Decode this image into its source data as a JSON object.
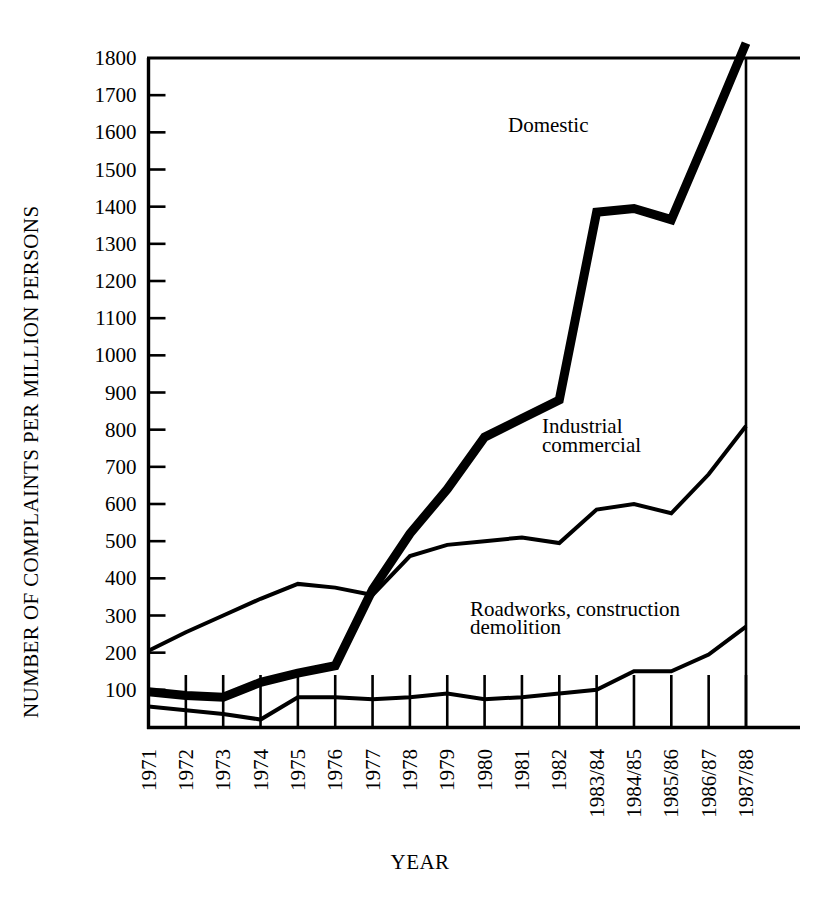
{
  "chart_data": {
    "type": "line",
    "title": "",
    "xlabel": "YEAR",
    "ylabel": "NUMBER OF COMPLAINTS PER MILLION PERSONS",
    "categories": [
      "1971",
      "1972",
      "1973",
      "1974",
      "1975",
      "1976",
      "1977",
      "1978",
      "1979",
      "1980",
      "1981",
      "1982",
      "1983/84",
      "1984/85",
      "1985/86",
      "1986/87",
      "1987/88"
    ],
    "ylim": [
      0,
      1800
    ],
    "yticks": [
      100,
      200,
      300,
      400,
      500,
      600,
      700,
      800,
      900,
      1000,
      1100,
      1200,
      1300,
      1400,
      1500,
      1600,
      1700,
      1800
    ],
    "ytick_labels": [
      "100",
      "200",
      "300",
      "400",
      "500",
      "600",
      "700",
      "800",
      "900",
      "1000",
      "1100",
      "1200",
      "1300",
      "1400",
      "1500",
      "1600",
      "1700",
      "1800"
    ],
    "grid": false,
    "legend": "inline-annotations",
    "series": [
      {
        "name": "Domestic",
        "label": "Domestic",
        "stroke_width": 9,
        "values": [
          95,
          85,
          80,
          120,
          145,
          165,
          370,
          520,
          640,
          780,
          830,
          880,
          1385,
          1395,
          1365,
          1600,
          1840
        ]
      },
      {
        "name": "Industrial commercial",
        "label_line1": "Industrial",
        "label_line2": "commercial",
        "stroke_width": 4,
        "values": [
          205,
          255,
          300,
          345,
          385,
          375,
          355,
          460,
          490,
          500,
          510,
          495,
          585,
          600,
          575,
          680,
          810
        ]
      },
      {
        "name": "Roadworks, construction demolition",
        "label_line1": "Roadworks, construction",
        "label_line2": "demolition",
        "stroke_width": 4,
        "values": [
          55,
          45,
          35,
          20,
          80,
          80,
          75,
          80,
          90,
          75,
          80,
          90,
          100,
          150,
          150,
          195,
          270
        ]
      }
    ],
    "annotations": [
      {
        "text": "Domestic",
        "x_index": 12,
        "value": 1600
      },
      {
        "text": "Industrial",
        "x_index": 12,
        "value": 790
      },
      {
        "text": "commercial",
        "x_index": 12,
        "value": 740
      },
      {
        "text": "Roadworks, construction",
        "x_index": 9,
        "value": 300
      },
      {
        "text": "demolition",
        "x_index": 9,
        "value": 250
      }
    ],
    "colors": {
      "line": "#000000",
      "axis": "#000000",
      "background": "#ffffff"
    }
  }
}
